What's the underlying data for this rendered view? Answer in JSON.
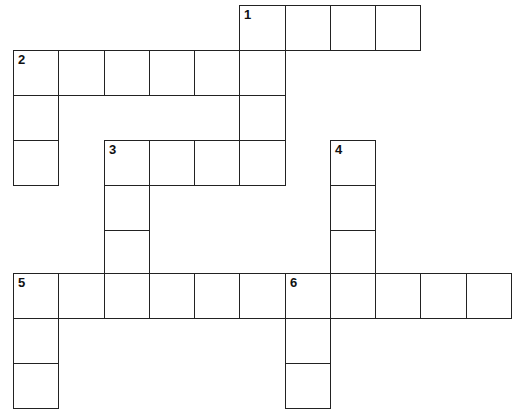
{
  "puzzle": {
    "title": "",
    "colors": {
      "border": "#222222",
      "cell": "#ffffff",
      "number": "#111111"
    },
    "grid": {
      "origin_x": 13,
      "origin_y": 5,
      "col_lines": [
        13,
        58,
        104,
        149,
        194,
        239,
        285,
        330,
        375,
        420,
        466,
        511
      ],
      "row_lines": [
        5,
        50,
        95,
        140,
        185,
        230,
        273,
        318,
        363,
        408
      ]
    },
    "cells": [
      {
        "r": 0,
        "c": 5,
        "num": "1"
      },
      {
        "r": 0,
        "c": 6
      },
      {
        "r": 0,
        "c": 7
      },
      {
        "r": 0,
        "c": 8
      },
      {
        "r": 1,
        "c": 0,
        "num": "2"
      },
      {
        "r": 1,
        "c": 1
      },
      {
        "r": 1,
        "c": 2
      },
      {
        "r": 1,
        "c": 3
      },
      {
        "r": 1,
        "c": 4
      },
      {
        "r": 1,
        "c": 5
      },
      {
        "r": 2,
        "c": 0
      },
      {
        "r": 2,
        "c": 5
      },
      {
        "r": 3,
        "c": 0
      },
      {
        "r": 3,
        "c": 2,
        "num": "3"
      },
      {
        "r": 3,
        "c": 3
      },
      {
        "r": 3,
        "c": 4
      },
      {
        "r": 3,
        "c": 5
      },
      {
        "r": 3,
        "c": 7,
        "num": "4"
      },
      {
        "r": 4,
        "c": 2
      },
      {
        "r": 4,
        "c": 7
      },
      {
        "r": 5,
        "c": 2
      },
      {
        "r": 5,
        "c": 7
      },
      {
        "r": 6,
        "c": 0,
        "num": "5"
      },
      {
        "r": 6,
        "c": 1
      },
      {
        "r": 6,
        "c": 2
      },
      {
        "r": 6,
        "c": 3
      },
      {
        "r": 6,
        "c": 4
      },
      {
        "r": 6,
        "c": 5
      },
      {
        "r": 6,
        "c": 6,
        "num": "6"
      },
      {
        "r": 6,
        "c": 7
      },
      {
        "r": 6,
        "c": 8
      },
      {
        "r": 6,
        "c": 9
      },
      {
        "r": 6,
        "c": 10
      },
      {
        "r": 7,
        "c": 0
      },
      {
        "r": 7,
        "c": 6
      },
      {
        "r": 8,
        "c": 0
      },
      {
        "r": 8,
        "c": 6
      }
    ],
    "clue_numbers": [
      "1",
      "2",
      "3",
      "4",
      "5",
      "6"
    ]
  }
}
